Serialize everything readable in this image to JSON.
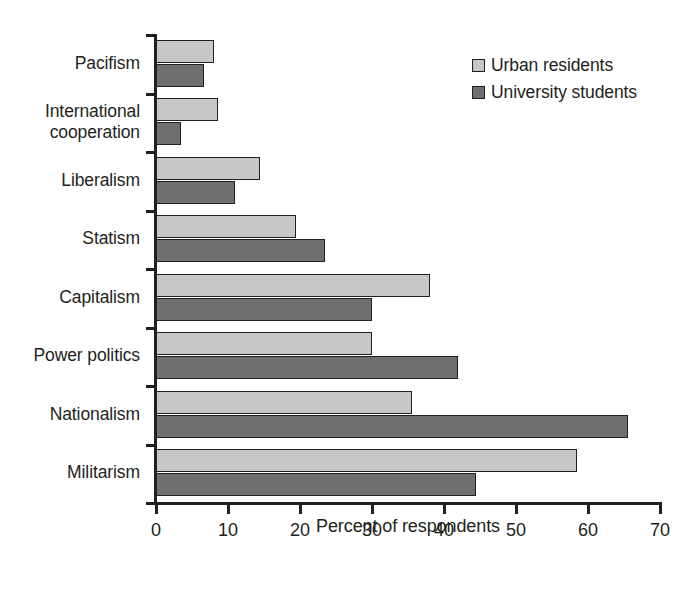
{
  "chart_data": {
    "type": "bar",
    "orientation": "horizontal",
    "title": "",
    "xlabel": "Percent of respondents",
    "ylabel": "",
    "xlim": [
      0,
      70
    ],
    "xticks": [
      0,
      10,
      20,
      30,
      40,
      50,
      60,
      70
    ],
    "grid": false,
    "legend_position": "top-right",
    "categories": [
      "Pacifism",
      "International cooperation",
      "Liberalism",
      "Statism",
      "Capitalism",
      "Power politics",
      "Nationalism",
      "Militarism"
    ],
    "series": [
      {
        "name": "Urban residents",
        "color": "#c7c7c7",
        "values": [
          8,
          8.6,
          14.5,
          19.5,
          38,
          30,
          35.5,
          58.5
        ]
      },
      {
        "name": "University students",
        "color": "#6f6f6f",
        "values": [
          6.7,
          3.5,
          11,
          23.5,
          30,
          42,
          65.5,
          44.5
        ]
      }
    ]
  },
  "legend": {
    "items": [
      {
        "label": "Urban residents",
        "swatch": "light"
      },
      {
        "label": "University students",
        "swatch": "dark"
      }
    ]
  },
  "axis": {
    "x_title": "Percent of respondents"
  },
  "colors": {
    "urban_residents": "#c7c7c7",
    "university_students": "#6f6f6f",
    "axis": "#231f20",
    "background": "#ffffff"
  }
}
